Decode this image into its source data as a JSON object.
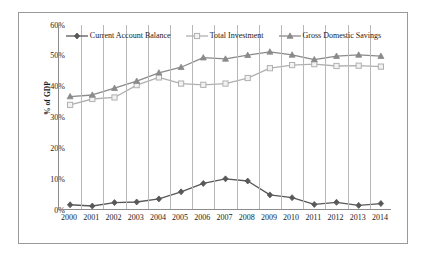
{
  "figure": {
    "y_axis_title": "% of GDP",
    "legend_position": "top-center",
    "background": "#ffffff",
    "border_color": "#9a9a9a"
  },
  "chart_data": {
    "type": "line",
    "title": "",
    "xlabel": "",
    "ylabel": "% of GDP",
    "ylim": [
      0,
      60
    ],
    "ytick_labels": [
      "0%",
      "10%",
      "20%",
      "30%",
      "40%",
      "50%",
      "60%"
    ],
    "ytick_values": [
      0,
      10,
      20,
      30,
      40,
      50,
      60
    ],
    "grid": "vertical-only",
    "categories": [
      "2000",
      "2001",
      "2002",
      "2003",
      "2004",
      "2005",
      "2006",
      "2007",
      "2008",
      "2009",
      "2010",
      "2011",
      "2012",
      "2013",
      "2014"
    ],
    "x": [
      2000,
      2001,
      2002,
      2003,
      2004,
      2005,
      2006,
      2007,
      2008,
      2009,
      2010,
      2011,
      2012,
      2013,
      2014
    ],
    "series": [
      {
        "name": "Current Account Balance",
        "marker": "diamond",
        "color": "#585858",
        "values": [
          1.7,
          1.3,
          2.4,
          2.6,
          3.6,
          5.9,
          8.6,
          10.1,
          9.4,
          4.9,
          4.0,
          1.8,
          2.5,
          1.5,
          2.1
        ]
      },
      {
        "name": "Total Investment",
        "marker": "square",
        "color": "#b0b0b0",
        "values": [
          34.1,
          36.0,
          36.5,
          40.5,
          43.0,
          41.0,
          40.6,
          41.0,
          42.8,
          46.0,
          47.0,
          47.3,
          46.7,
          46.8,
          46.5
        ]
      },
      {
        "name": "Gross Domestic Savings",
        "marker": "triangle",
        "color": "#8a8a8a",
        "values": [
          36.8,
          37.3,
          39.5,
          41.8,
          44.5,
          46.3,
          49.4,
          49.0,
          50.2,
          51.3,
          50.3,
          48.8,
          49.9,
          50.3,
          49.9
        ]
      }
    ]
  }
}
